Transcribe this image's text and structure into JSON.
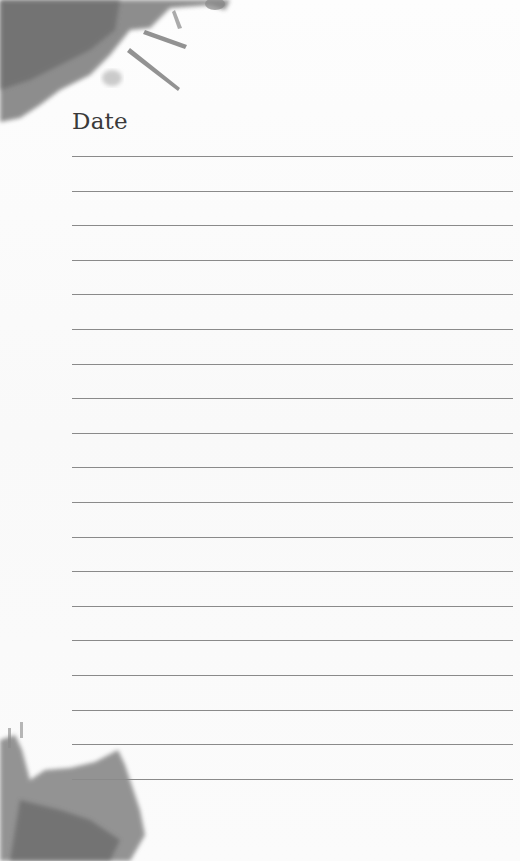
{
  "page": {
    "title": "Date",
    "line_count": 19,
    "line_start_y": 156,
    "line_spacing": 34.6,
    "colors": {
      "background": "#fbfbfb",
      "ink": "#3a3a3a",
      "rule": "#8a8a8a",
      "splash": "#6f6f6f"
    }
  }
}
